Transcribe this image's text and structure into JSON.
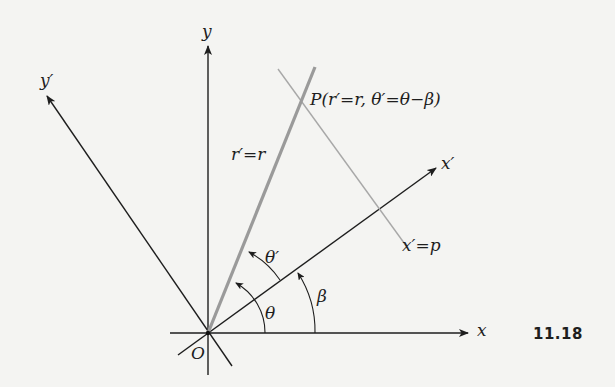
{
  "figure": {
    "number": "11.18",
    "origin_label": "O",
    "axes": {
      "x": "x",
      "y": "y",
      "x_prime": "x′",
      "y_prime": "y′"
    },
    "point_label": "P(r′=r, θ′=θ−β)",
    "ray_label": "r′=r",
    "line_label": "x′=p",
    "angles": {
      "theta": "θ",
      "theta_prime": "θ′",
      "beta": "β"
    },
    "colors": {
      "axis": "#1e1e1e",
      "ray": "#9a9a9a",
      "line": "#a8a8a8",
      "background": "#f4f4f2"
    }
  }
}
